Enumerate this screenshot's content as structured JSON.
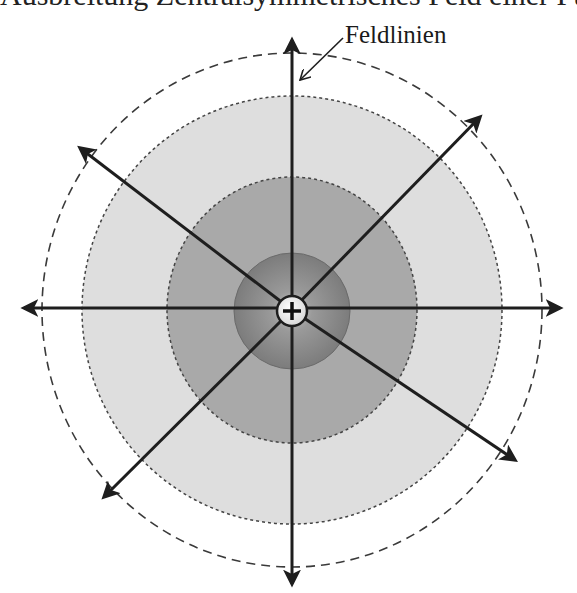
{
  "title": {
    "text": "Ausbreitung Zentralsymmetrisches Feld einer Punktladung",
    "note": "cropped at top edge; only glyph descenders visible"
  },
  "labels": {
    "field_lines": "Feldlinien"
  },
  "charge": {
    "symbol": "+",
    "type": "positive-point-charge",
    "center": [
      292,
      310
    ]
  },
  "colors": {
    "background": "#ffffff",
    "zone_light": "#dedede",
    "zone_medium": "#a9a9a9",
    "zone_dark": "#7f7f7f",
    "zone_dark_center": "#b8b8b8",
    "line": "#1e1e1e",
    "dash": "#3a3a3a"
  },
  "rings": [
    {
      "name": "outer-equipotential",
      "style": "dashed",
      "rx": 250,
      "ry": 257
    },
    {
      "name": "light-zone",
      "style": "dotted",
      "rx": 210,
      "ry": 214
    },
    {
      "name": "medium-zone",
      "style": "dotted",
      "rx": 125,
      "ry": 133
    },
    {
      "name": "dark-zone",
      "style": "solid-edge",
      "rx": 58,
      "ry": 58
    }
  ],
  "field_lines": [
    {
      "name": "up",
      "tip": [
        292,
        33
      ]
    },
    {
      "name": "down",
      "tip": [
        292,
        591
      ]
    },
    {
      "name": "left",
      "tip": [
        17,
        308
      ]
    },
    {
      "name": "right",
      "tip": [
        567,
        308
      ]
    },
    {
      "name": "upper-left",
      "tip": [
        74,
        144
      ]
    },
    {
      "name": "upper-right",
      "tip": [
        485,
        112
      ]
    },
    {
      "name": "lower-right",
      "tip": [
        521,
        465
      ]
    },
    {
      "name": "lower-left",
      "tip": [
        99,
        502
      ]
    }
  ]
}
